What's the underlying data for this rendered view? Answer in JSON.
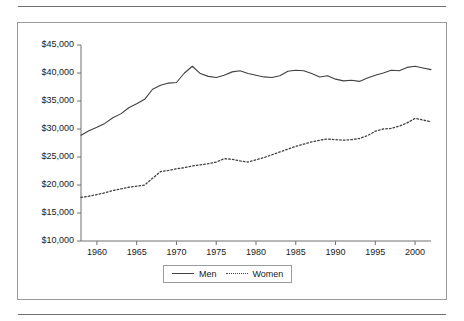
{
  "figure": {
    "has_top_rule": true,
    "has_bottom_rule": true,
    "frame_color": "#9a9b9e",
    "background": "#ffffff"
  },
  "legend": {
    "position": "bottom-center",
    "entries": [
      {
        "label": "Men",
        "style": "solid",
        "icon": "solid-line-swatch"
      },
      {
        "label": "Women",
        "style": "dotted",
        "icon": "dotted-line-swatch"
      }
    ]
  },
  "chart_data": {
    "type": "line",
    "title": "",
    "subtitle": "",
    "xlabel": "",
    "ylabel": "",
    "xlim": [
      1958,
      2002
    ],
    "ylim": [
      10000,
      45000
    ],
    "ytick_step": 5000,
    "xtick_step": 5,
    "grid": false,
    "legend_position": "bottom-center",
    "ytick_labels": [
      "$10,000",
      "$15,000",
      "$20,000",
      "$25,000",
      "$30,000",
      "$35,000",
      "$40,000",
      "$45,000"
    ],
    "ytick_values": [
      10000,
      15000,
      20000,
      25000,
      30000,
      35000,
      40000,
      45000
    ],
    "xtick_labels": [
      "1960",
      "1965",
      "1970",
      "1975",
      "1980",
      "1985",
      "1990",
      "1995",
      "2000"
    ],
    "xtick_values": [
      1960,
      1965,
      1970,
      1975,
      1980,
      1985,
      1990,
      1995,
      2000
    ],
    "x": [
      1958,
      1959,
      1960,
      1961,
      1962,
      1963,
      1964,
      1965,
      1966,
      1967,
      1968,
      1969,
      1970,
      1971,
      1972,
      1973,
      1974,
      1975,
      1976,
      1977,
      1978,
      1979,
      1980,
      1981,
      1982,
      1983,
      1984,
      1985,
      1986,
      1987,
      1988,
      1989,
      1990,
      1991,
      1992,
      1993,
      1994,
      1995,
      1996,
      1997,
      1998,
      1999,
      2000,
      2001,
      2002
    ],
    "series": [
      {
        "name": "Men",
        "style": "solid",
        "color": "#404040",
        "values": [
          28900,
          29700,
          30300,
          31000,
          32000,
          32700,
          33800,
          34500,
          35300,
          37100,
          37800,
          38200,
          38300,
          40000,
          41200,
          39900,
          39400,
          39200,
          39600,
          40200,
          40400,
          39900,
          39600,
          39300,
          39200,
          39500,
          40300,
          40500,
          40400,
          39900,
          39300,
          39500,
          38900,
          38600,
          38700,
          38500,
          39100,
          39600,
          40000,
          40500,
          40400,
          41000,
          41200,
          40900,
          40600
        ]
      },
      {
        "name": "Women",
        "style": "dotted",
        "color": "#404040",
        "values": [
          17800,
          18000,
          18300,
          18600,
          19000,
          19300,
          19600,
          19800,
          20000,
          21200,
          22400,
          22600,
          22900,
          23100,
          23400,
          23600,
          23800,
          24100,
          24700,
          24600,
          24300,
          24100,
          24500,
          24900,
          25400,
          25900,
          26400,
          26900,
          27300,
          27700,
          28000,
          28200,
          28100,
          28000,
          28100,
          28300,
          28800,
          29600,
          30000,
          30100,
          30500,
          31100,
          31900,
          31600,
          31300
        ]
      }
    ]
  }
}
